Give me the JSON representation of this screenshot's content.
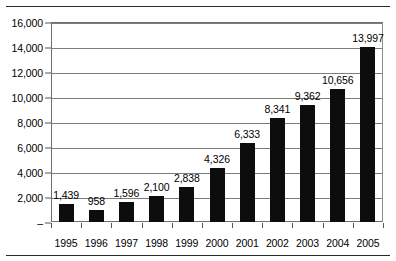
{
  "chart_data": {
    "type": "bar",
    "title": "",
    "subtitle": "",
    "xlabel": "",
    "ylabel": "",
    "categories": [
      "1995",
      "1996",
      "1997",
      "1998",
      "1999",
      "2000",
      "2001",
      "2002",
      "2003",
      "2004",
      "2005"
    ],
    "values": [
      1439,
      958,
      1596,
      2100,
      2838,
      4326,
      6333,
      8341,
      9362,
      10656,
      13997
    ],
    "value_labels": [
      "1,439",
      "958",
      "1,596",
      "2,100",
      "2,838",
      "4,326",
      "6,333",
      "8,341",
      "9,362",
      "10,656",
      "13,997"
    ],
    "ylim": [
      0,
      16000
    ],
    "ytick_values": [
      16000,
      14000,
      12000,
      10000,
      8000,
      6000,
      4000,
      2000,
      0
    ],
    "ytick_labels": [
      "16,000",
      "14,000",
      "12,000",
      "10,000",
      "8,000",
      "6,000",
      "4,000",
      "2,000",
      "–"
    ],
    "grid": true,
    "legend": false,
    "legend_position": "none",
    "series": [
      {
        "name": "Series 1",
        "color": "#0d0d0d",
        "values": [
          1439,
          958,
          1596,
          2100,
          2838,
          4326,
          6333,
          8341,
          9362,
          10656,
          13997
        ]
      }
    ],
    "annotations": []
  },
  "style": {
    "bar_color": "#0d0d0d",
    "grid_color": "#7d7d7d",
    "frame_color": "#6f6f6f",
    "rule_color": "#2b2b2b",
    "text_color": "#000000",
    "background": "#ffffff"
  }
}
